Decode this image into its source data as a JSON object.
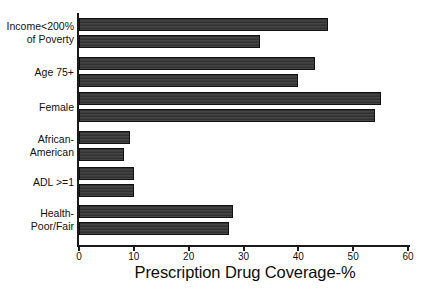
{
  "chart_data": {
    "type": "bar",
    "orientation": "horizontal",
    "title": "",
    "xlabel": "Prescription Drug Coverage-%",
    "ylabel": "",
    "xlim": [
      0,
      60
    ],
    "xticks": [
      0,
      10,
      20,
      30,
      40,
      50,
      60
    ],
    "xtick_labels": [
      "0",
      "10",
      "20",
      "30",
      "40",
      "50",
      "60"
    ],
    "grid": false,
    "legend": false,
    "bar_color": "#3a3a3a",
    "axis_color": "#1a1a1a",
    "categories": [
      "Income<200% of Poverty",
      "Age 75+",
      "Female",
      "African-American",
      "ADL >=1",
      "Health-Poor/Fair"
    ],
    "category_labels": [
      {
        "line1": "Income<200%",
        "line2": "of Poverty"
      },
      {
        "line1": "Age 75+",
        "line2": ""
      },
      {
        "line1": "Female",
        "line2": ""
      },
      {
        "line1": "African-",
        "line2": "American"
      },
      {
        "line1": "ADL >=1",
        "line2": ""
      },
      {
        "line1": "Health-",
        "line2": "Poor/Fair"
      }
    ],
    "series": [
      {
        "name": "series-1",
        "values": [
          45.5,
          43.0,
          55.0,
          9.3,
          10.0,
          28.0
        ]
      },
      {
        "name": "series-2",
        "values": [
          33.0,
          40.0,
          54.0,
          8.2,
          10.0,
          27.3
        ]
      }
    ],
    "bars": [
      {
        "category": "Income<200% of Poverty",
        "series": "series-1",
        "value": 45.5
      },
      {
        "category": "Income<200% of Poverty",
        "series": "series-2",
        "value": 33.0
      },
      {
        "category": "Age 75+",
        "series": "series-1",
        "value": 43.0
      },
      {
        "category": "Age 75+",
        "series": "series-2",
        "value": 40.0
      },
      {
        "category": "Female",
        "series": "series-1",
        "value": 55.0
      },
      {
        "category": "Female",
        "series": "series-2",
        "value": 54.0
      },
      {
        "category": "African-American",
        "series": "series-1",
        "value": 9.3
      },
      {
        "category": "African-American",
        "series": "series-2",
        "value": 8.2
      },
      {
        "category": "ADL >=1",
        "series": "series-1",
        "value": 10.0
      },
      {
        "category": "ADL >=1",
        "series": "series-2",
        "value": 10.0
      },
      {
        "category": "Health-Poor/Fair",
        "series": "series-1",
        "value": 28.0
      },
      {
        "category": "Health-Poor/Fair",
        "series": "series-2",
        "value": 27.3
      }
    ]
  }
}
